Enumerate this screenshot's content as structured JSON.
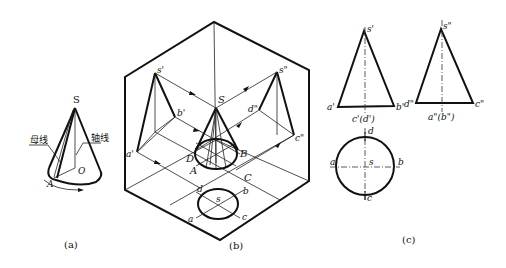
{
  "figure": {
    "panel_a": {
      "caption": "(a)",
      "apex": "S",
      "base_center": "O",
      "base_point": "A",
      "generatrix_label": "母线",
      "axis_label": "轴线"
    },
    "panel_b": {
      "caption": "(b)",
      "apex": "S",
      "base_points": [
        "A",
        "B",
        "C",
        "D"
      ],
      "front_projection": {
        "apex": "s'",
        "left": "a'",
        "right": "b'"
      },
      "side_projection": {
        "apex": "s\"",
        "left": "d\"",
        "right": "c\""
      },
      "top_projection": {
        "center": "s",
        "points": [
          "a",
          "b",
          "c",
          "d"
        ]
      }
    },
    "panel_c": {
      "caption": "(c)",
      "front_view": {
        "apex": "s'",
        "left": "a'",
        "right": "b'",
        "bottom_label": "c'(d')"
      },
      "side_view": {
        "apex": "s\"",
        "left": "d\"",
        "right": "c\"",
        "bottom_label": "a\"(b\")"
      },
      "top_view": {
        "center": "s",
        "top": "d",
        "bottom": "c",
        "left": "a",
        "right": "b"
      }
    }
  }
}
